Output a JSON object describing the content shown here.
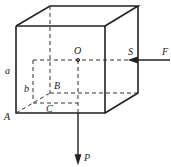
{
  "diagram": {
    "labels": {
      "O": "O",
      "S": "S",
      "F": "F",
      "a": "a",
      "b": "b",
      "B": "B",
      "C": "C",
      "A": "A",
      "P": "P"
    }
  }
}
